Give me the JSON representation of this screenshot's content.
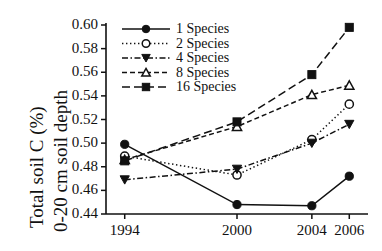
{
  "chart_data": {
    "type": "line",
    "title": "",
    "xlabel": "",
    "ylabel": "Total soil C (%) 0-20 cm soil depth",
    "ylabel_lines": [
      "Total soil C (%)",
      "0-20 cm soil depth"
    ],
    "x": [
      1994,
      2000,
      2004,
      2006
    ],
    "categories": [
      "1994",
      "2000",
      "2004",
      "2006"
    ],
    "xtick_labels": [
      "1994",
      "2000",
      "2004",
      "2006"
    ],
    "ytick_labels": [
      "0.60",
      "0.58",
      "0.56",
      "0.54",
      "0.52",
      "0.50",
      "0.48",
      "0.46",
      "0.44"
    ],
    "ytick_values": [
      0.6,
      0.58,
      0.56,
      0.54,
      0.52,
      0.5,
      0.48,
      0.46,
      0.44
    ],
    "ylim": [
      0.44,
      0.6
    ],
    "xlim": [
      1993,
      2007
    ],
    "grid": false,
    "legend_position": "top-left",
    "series": [
      {
        "name": "1 Species",
        "values": [
          0.499,
          0.448,
          0.447,
          0.472
        ],
        "marker": "filled-circle",
        "linestyle": "solid",
        "color": "#111111"
      },
      {
        "name": "2 Species",
        "values": [
          0.489,
          0.473,
          0.503,
          0.533
        ],
        "marker": "open-circle",
        "linestyle": "dotted",
        "color": "#111111"
      },
      {
        "name": "4 Species",
        "values": [
          0.469,
          0.478,
          0.5,
          0.516
        ],
        "marker": "filled-triangle-down",
        "linestyle": "dash-dot",
        "color": "#111111"
      },
      {
        "name": "8 Species",
        "values": [
          0.486,
          0.514,
          0.541,
          0.549
        ],
        "marker": "open-triangle-up",
        "linestyle": "dashed",
        "color": "#111111"
      },
      {
        "name": "16 Species",
        "values": [
          0.485,
          0.518,
          0.558,
          0.598
        ],
        "marker": "filled-square",
        "linestyle": "long-dash",
        "color": "#111111"
      }
    ]
  },
  "legend": {
    "entries": [
      {
        "label": "1 Species"
      },
      {
        "label": "2 Species"
      },
      {
        "label": "4 Species"
      },
      {
        "label": "8 Species"
      },
      {
        "label": "16 Species"
      }
    ]
  },
  "colors": {
    "ink": "#111111",
    "background": "#ffffff"
  }
}
